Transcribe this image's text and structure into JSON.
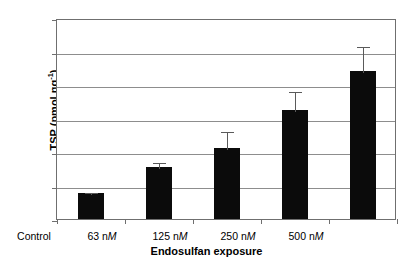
{
  "chart_data": {
    "type": "bar",
    "title": "",
    "subtitle": "",
    "xlabel": "Endosulfan exposure",
    "ylabel": "TSP (pmol ng⁻¹)",
    "ylabel_main": "TSP (pmol ng",
    "ylabel_sup": "-1",
    "ylabel_close": ")",
    "categories": [
      "Control",
      "63 nM",
      "125 nM",
      "250 nM",
      "500 nM"
    ],
    "category_parts": [
      {
        "text": "Control",
        "italic": ""
      },
      {
        "text": "63 n",
        "italic": "M"
      },
      {
        "text": "125 n",
        "italic": "M"
      },
      {
        "text": "250 n",
        "italic": "M"
      },
      {
        "text": "500 n",
        "italic": "M"
      }
    ],
    "values": [
      15.5,
      31.2,
      42.5,
      65.3,
      88.2
    ],
    "errors": [
      1.0,
      3.5,
      10.5,
      11.5,
      15.5
    ],
    "ylim": [
      0,
      120
    ],
    "ytick_values": [
      0,
      20,
      40,
      60,
      80,
      100,
      120
    ],
    "ytick_labels": [
      "0",
      "20",
      "40",
      "60",
      "80",
      "100",
      "120"
    ],
    "grid": true,
    "grid_axis": "y",
    "legend": false,
    "legend_position": "none",
    "bar_color": "#0b0b0b",
    "errorbar_color": "#5a5a5a",
    "grid_color": "#8d8d8d",
    "frame_color": "#6f6f6f",
    "background_color": "#ffffff"
  }
}
